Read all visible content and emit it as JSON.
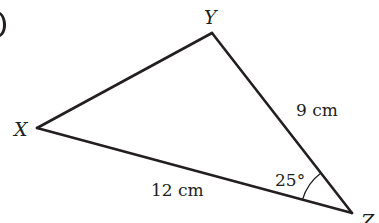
{
  "diagram": {
    "type": "triangle",
    "vertices": [
      {
        "id": "X",
        "label": "X",
        "x": 37,
        "y": 128
      },
      {
        "id": "Y",
        "label": "Y",
        "x": 212,
        "y": 33
      },
      {
        "id": "Z",
        "label": "Z",
        "x": 352,
        "y": 213
      }
    ],
    "sides": [
      {
        "from": "Y",
        "to": "Z",
        "label": "9 cm"
      },
      {
        "from": "X",
        "to": "Z",
        "label": "12 cm"
      },
      {
        "from": "X",
        "to": "Y",
        "label": ""
      }
    ],
    "angles": [
      {
        "vertex": "Z",
        "label": "25°"
      }
    ],
    "colors": {
      "stroke": "#231f20",
      "background": "#ffffff"
    }
  }
}
